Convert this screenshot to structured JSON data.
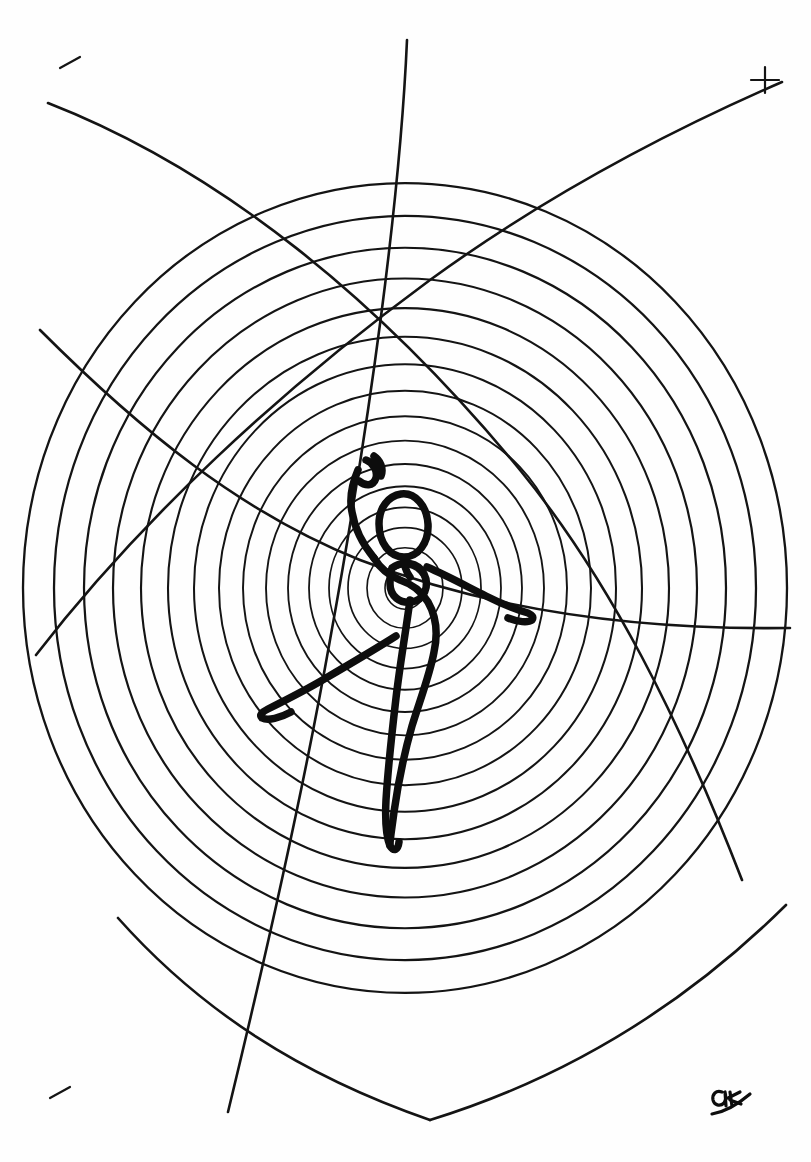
{
  "artwork": {
    "title": "Dancer on Concentric Circles",
    "subject": "continuous-line ink drawing of a ballerina in arabesque",
    "medium": "pen and ink line drawing",
    "background_color": "#fefefe",
    "ink_color": "#111111",
    "canvas": {
      "width": 811,
      "height": 1162
    },
    "top_edge_fragment": "· · ·",
    "signature": {
      "present": true,
      "text": "monogram",
      "position": "bottom-right",
      "x": 728,
      "y": 1100
    },
    "registration_marks": [
      {
        "name": "tick-top-left",
        "x": 70,
        "y": 62
      },
      {
        "name": "cross-top-right",
        "x": 765,
        "y": 80
      },
      {
        "name": "tick-bottom-left",
        "x": 60,
        "y": 1092
      }
    ]
  },
  "chart_data": {
    "type": "line",
    "xlabel": "",
    "ylabel": "",
    "grid": false,
    "legend_position": "none",
    "center": {
      "x": 405,
      "y": 588
    },
    "circle_count": 16,
    "circle_radii": [
      20,
      38,
      57,
      76,
      96,
      117,
      139,
      162,
      186,
      211,
      237,
      264,
      292,
      321,
      351,
      382
    ],
    "circle_squash_y": 1.06,
    "stroke_width_circles": 1.6,
    "stroke_width_figure": 7.5,
    "stroke_width_arcs": 2.6,
    "arcs": [
      {
        "name": "arc-descending-left-to-right",
        "path": "M 48,103 C 220,170 380,300 520,470 C 610,580 680,720 742,880",
        "note": "sweeping arc from upper-left to lower-right"
      },
      {
        "name": "arc-ascending-left-to-right",
        "path": "M 36,655 C 140,520 280,390 430,280 C 540,200 660,135 782,82",
        "note": "sweeping arc from lower-left to upper-right"
      },
      {
        "name": "arc-lower-left-sweep",
        "path": "M 118,918 C 200,1010 300,1075 430,1120",
        "note": "short arc lower left"
      },
      {
        "name": "arc-lower-right-sweep",
        "path": "M 430,1120 C 560,1080 680,1010 786,905",
        "note": "short arc lower right"
      },
      {
        "name": "arc-crossing-vertical",
        "path": "M 407,40 C 400,200 370,420 330,640 C 300,810 260,980 228,1112",
        "note": "long near-vertical arc crossing the centre"
      },
      {
        "name": "arc-crossing-diagonal",
        "path": "M 790,628 C 650,630 500,614 360,560 C 240,512 140,430 40,330",
        "note": "long arc crossing right to upper-left"
      }
    ],
    "figure": {
      "name": "ballerina",
      "pose": "arabesque / attitude with one arm raised and one extended",
      "head": {
        "cx": 398,
        "cy": 520,
        "rx": 21,
        "ry": 27,
        "rotation": -16
      },
      "torso_center": {
        "x": 405,
        "y": 585
      },
      "raised_arm_tip": {
        "x": 371,
        "y": 455
      },
      "extended_arm_tip": {
        "x": 532,
        "y": 620
      },
      "extended_leg_tip": {
        "x": 262,
        "y": 715
      },
      "supporting_foot": {
        "x": 392,
        "y": 845
      },
      "strokes": [
        {
          "name": "raised-arm-and-hand",
          "d": "M 366,460 C 372,462 378,470 376,478 C 373,487 365,486 359,481 M 374,456 C 380,460 384,468 381,476 M 358,470 C 352,484 349,498 352,512 C 355,530 364,546 374,558"
        },
        {
          "name": "head-and-neck",
          "d": "M 401,494 C 415,492 427,506 428,524 C 429,543 418,557 404,557 C 390,557 379,543 379,524 C 379,508 388,496 401,494 Z M 404,557 C 404,566 406,572 410,577"
        },
        {
          "name": "body-line",
          "d": "M 374,558 C 380,568 390,576 400,580 C 412,584 422,592 428,602 C 436,616 438,634 434,652 C 430,674 420,700 412,726 C 404,754 398,784 394,812 C 392,828 390,838 390,845"
        },
        {
          "name": "arm-extended-right",
          "d": "M 427,567 C 446,575 466,586 486,596 C 500,603 514,609 528,613 C 532,615 534,617 532,620 C 528,623 518,622 508,618"
        },
        {
          "name": "leg-extended-left",
          "d": "M 396,636 C 374,650 350,664 326,678 C 306,690 286,700 268,709 C 262,712 259,715 262,718 C 268,721 280,718 291,712"
        },
        {
          "name": "supporting-leg",
          "d": "M 410,600 C 406,630 400,664 396,698 C 392,732 388,768 386,800 C 385,820 386,836 390,846 C 394,852 398,850 399,842"
        },
        {
          "name": "hip-loop",
          "d": "M 392,568 C 402,560 418,562 424,574 C 430,586 424,600 412,602 C 400,604 390,596 390,584 C 390,576 390,572 392,568 Z"
        }
      ]
    }
  }
}
